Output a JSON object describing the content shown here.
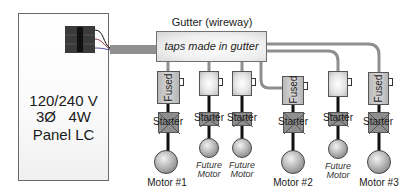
{
  "panel": {
    "voltage": "120/240 V",
    "phase": "3Ø   4W",
    "name": "Panel LC"
  },
  "gutter": {
    "label": "Gutter (wireway)",
    "note": "taps made in gutter"
  },
  "columns": [
    {
      "disconnect": "Fused",
      "starter": "Starter",
      "motor": "Motor #1",
      "future": false
    },
    {
      "disconnect": "",
      "starter": "Starter",
      "motor": "Future Motor",
      "future": true,
      "line1": "Future",
      "line2": "Motor"
    },
    {
      "disconnect": "",
      "starter": "Starter",
      "motor": "Future Motor",
      "future": true,
      "line1": "Future",
      "line2": "Motor"
    },
    {
      "disconnect": "Fused",
      "starter": "Starter",
      "motor": "Motor #2",
      "future": false
    },
    {
      "disconnect": "",
      "starter": "Starter",
      "motor": "Future Motor",
      "future": true,
      "line1": "Future",
      "line2": "Motor"
    },
    {
      "disconnect": "Fused",
      "starter": "Starter",
      "motor": "Motor #3",
      "future": false
    }
  ],
  "colors": {
    "conduit": "#8f8f8f",
    "connector": "#3a3a3a",
    "wire": "#111111"
  }
}
